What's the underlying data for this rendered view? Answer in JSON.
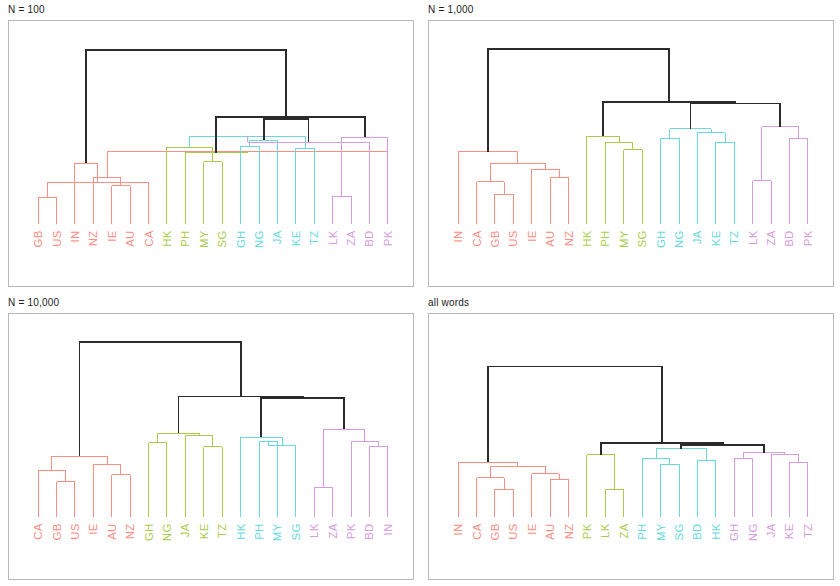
{
  "figure": {
    "width": 840,
    "height": 586,
    "background": "#ffffff",
    "panel_count": 4
  },
  "palette": {
    "red": "#f98d81",
    "green": "#a8cd4a",
    "cyan": "#67d9de",
    "magenta": "#d79ae0",
    "root": "#2b2b2b",
    "frame": "#b9b9b9",
    "title": "#1c1c1c"
  },
  "panels": [
    {
      "id": "panel-n-100",
      "title": "N = 100",
      "chart_data": {
        "type": "dendrogram",
        "title": "N = 100",
        "leaves": [
          "GB",
          "US",
          "IN",
          "NZ",
          "IE",
          "AU",
          "CA",
          "HK",
          "PH",
          "MY",
          "SG",
          "GH",
          "NG",
          "JA",
          "KE",
          "TZ",
          "LK",
          "ZA",
          "BD",
          "PK"
        ],
        "leaf_colors": [
          "red",
          "red",
          "red",
          "red",
          "red",
          "red",
          "red",
          "green",
          "green",
          "green",
          "green",
          "cyan",
          "cyan",
          "cyan",
          "cyan",
          "cyan",
          "magenta",
          "magenta",
          "magenta",
          "magenta"
        ],
        "ylim": [
          0,
          1
        ],
        "grid": false,
        "merges": [
          {
            "left": 0,
            "right": 1,
            "height": 0.14,
            "color": "red"
          },
          {
            "left": 4,
            "right": 5,
            "height": 0.2,
            "color": "red"
          },
          {
            "left": 20,
            "right": 6,
            "height": 0.215,
            "color": "red"
          },
          {
            "left": 3,
            "right": 21,
            "height": 0.245,
            "color": "red"
          },
          {
            "left": 2,
            "right": 22,
            "height": 0.315,
            "color": "red"
          },
          {
            "left": 19,
            "right": 23,
            "height": 0.375,
            "color": "red"
          },
          {
            "left": 9,
            "right": 10,
            "height": 0.325,
            "color": "green"
          },
          {
            "left": 8,
            "right": 25,
            "height": 0.37,
            "color": "green"
          },
          {
            "left": 7,
            "right": 26,
            "height": 0.4,
            "color": "green"
          },
          {
            "left": 11,
            "right": 12,
            "height": 0.405,
            "color": "cyan"
          },
          {
            "left": 14,
            "right": 15,
            "height": 0.395,
            "color": "cyan"
          },
          {
            "left": 13,
            "right": 29,
            "height": 0.435,
            "color": "cyan"
          },
          {
            "left": 28,
            "right": 30,
            "height": 0.455,
            "color": "cyan"
          },
          {
            "left": 16,
            "right": 17,
            "height": 0.145,
            "color": "magenta"
          },
          {
            "left": 32,
            "right": 18,
            "height": 0.425,
            "color": "magenta"
          },
          {
            "left": 33,
            "right": 19,
            "height": 0.45,
            "color": "magenta"
          },
          {
            "left": 31,
            "right": 34,
            "height": 0.545,
            "color": "root"
          },
          {
            "left": 27,
            "right": 35,
            "height": 0.555,
            "color": "root"
          },
          {
            "left": 24,
            "right": 36,
            "height": 0.9,
            "color": "root"
          }
        ]
      }
    },
    {
      "id": "panel-n-1000",
      "title": "N = 1,000",
      "chart_data": {
        "type": "dendrogram",
        "title": "N = 1,000",
        "leaves": [
          "IN",
          "CA",
          "GB",
          "US",
          "IE",
          "AU",
          "NZ",
          "HK",
          "PH",
          "MY",
          "SG",
          "GH",
          "NG",
          "JA",
          "KE",
          "TZ",
          "LK",
          "ZA",
          "BD",
          "PK"
        ],
        "leaf_colors": [
          "red",
          "red",
          "red",
          "red",
          "red",
          "red",
          "red",
          "green",
          "green",
          "green",
          "green",
          "cyan",
          "cyan",
          "cyan",
          "cyan",
          "cyan",
          "magenta",
          "magenta",
          "magenta",
          "magenta"
        ],
        "ylim": [
          0,
          1
        ],
        "grid": false,
        "merges": [
          {
            "left": 2,
            "right": 3,
            "height": 0.155,
            "color": "red"
          },
          {
            "left": 1,
            "right": 20,
            "height": 0.22,
            "color": "red"
          },
          {
            "left": 5,
            "right": 6,
            "height": 0.245,
            "color": "red"
          },
          {
            "left": 4,
            "right": 22,
            "height": 0.285,
            "color": "red"
          },
          {
            "left": 21,
            "right": 23,
            "height": 0.315,
            "color": "red"
          },
          {
            "left": 0,
            "right": 24,
            "height": 0.375,
            "color": "red"
          },
          {
            "left": 9,
            "right": 10,
            "height": 0.385,
            "color": "green"
          },
          {
            "left": 8,
            "right": 26,
            "height": 0.425,
            "color": "green"
          },
          {
            "left": 7,
            "right": 27,
            "height": 0.455,
            "color": "green"
          },
          {
            "left": 11,
            "right": 12,
            "height": 0.445,
            "color": "cyan"
          },
          {
            "left": 14,
            "right": 15,
            "height": 0.425,
            "color": "cyan"
          },
          {
            "left": 13,
            "right": 30,
            "height": 0.475,
            "color": "cyan"
          },
          {
            "left": 29,
            "right": 31,
            "height": 0.495,
            "color": "cyan"
          },
          {
            "left": 16,
            "right": 17,
            "height": 0.225,
            "color": "magenta"
          },
          {
            "left": 18,
            "right": 19,
            "height": 0.445,
            "color": "magenta"
          },
          {
            "left": 33,
            "right": 34,
            "height": 0.505,
            "color": "magenta"
          },
          {
            "left": 32,
            "right": 35,
            "height": 0.625,
            "color": "root"
          },
          {
            "left": 28,
            "right": 36,
            "height": 0.635,
            "color": "root"
          },
          {
            "left": 25,
            "right": 37,
            "height": 0.905,
            "color": "root"
          }
        ]
      }
    },
    {
      "id": "panel-n-10000",
      "title": "N = 10,000",
      "chart_data": {
        "type": "dendrogram",
        "title": "N = 10,000",
        "leaves": [
          "CA",
          "GB",
          "US",
          "IE",
          "AU",
          "NZ",
          "GH",
          "NG",
          "JA",
          "KE",
          "TZ",
          "HK",
          "PH",
          "MY",
          "SG",
          "LK",
          "ZA",
          "PK",
          "BD",
          "IN"
        ],
        "leaf_colors": [
          "red",
          "red",
          "red",
          "red",
          "red",
          "red",
          "green",
          "green",
          "green",
          "green",
          "green",
          "cyan",
          "cyan",
          "cyan",
          "cyan",
          "magenta",
          "magenta",
          "magenta",
          "magenta",
          "magenta"
        ],
        "ylim": [
          0,
          1
        ],
        "grid": false,
        "merges": [
          {
            "left": 1,
            "right": 2,
            "height": 0.185,
            "color": "red"
          },
          {
            "left": 0,
            "right": 20,
            "height": 0.245,
            "color": "red"
          },
          {
            "left": 4,
            "right": 5,
            "height": 0.22,
            "color": "red"
          },
          {
            "left": 3,
            "right": 22,
            "height": 0.275,
            "color": "red"
          },
          {
            "left": 21,
            "right": 23,
            "height": 0.315,
            "color": "red"
          },
          {
            "left": 6,
            "right": 7,
            "height": 0.385,
            "color": "green"
          },
          {
            "left": 9,
            "right": 10,
            "height": 0.365,
            "color": "green"
          },
          {
            "left": 8,
            "right": 26,
            "height": 0.425,
            "color": "green"
          },
          {
            "left": 25,
            "right": 27,
            "height": 0.435,
            "color": "green"
          },
          {
            "left": 12,
            "right": 13,
            "height": 0.395,
            "color": "cyan"
          },
          {
            "left": 29,
            "right": 14,
            "height": 0.37,
            "color": "cyan"
          },
          {
            "left": 11,
            "right": 30,
            "height": 0.415,
            "color": "cyan"
          },
          {
            "left": 15,
            "right": 16,
            "height": 0.155,
            "color": "magenta"
          },
          {
            "left": 18,
            "right": 19,
            "height": 0.365,
            "color": "magenta"
          },
          {
            "left": 17,
            "right": 33,
            "height": 0.395,
            "color": "magenta"
          },
          {
            "left": 32,
            "right": 34,
            "height": 0.455,
            "color": "magenta"
          },
          {
            "left": 31,
            "right": 35,
            "height": 0.615,
            "color": "root"
          },
          {
            "left": 28,
            "right": 36,
            "height": 0.625,
            "color": "root"
          },
          {
            "left": 24,
            "right": 37,
            "height": 0.905,
            "color": "root"
          }
        ]
      }
    },
    {
      "id": "panel-all-words",
      "title": "all words",
      "chart_data": {
        "type": "dendrogram",
        "title": "all words",
        "leaves": [
          "IN",
          "CA",
          "GB",
          "US",
          "IE",
          "AU",
          "NZ",
          "PK",
          "LK",
          "ZA",
          "PH",
          "MY",
          "SG",
          "BD",
          "HK",
          "GH",
          "NG",
          "JA",
          "KE",
          "TZ"
        ],
        "leaf_colors": [
          "red",
          "red",
          "red",
          "red",
          "red",
          "red",
          "red",
          "green",
          "green",
          "green",
          "cyan",
          "cyan",
          "cyan",
          "cyan",
          "cyan",
          "magenta",
          "magenta",
          "magenta",
          "magenta",
          "magenta"
        ],
        "ylim": [
          0,
          1
        ],
        "grid": false,
        "merges": [
          {
            "left": 2,
            "right": 3,
            "height": 0.145,
            "color": "red"
          },
          {
            "left": 1,
            "right": 20,
            "height": 0.205,
            "color": "red"
          },
          {
            "left": 5,
            "right": 6,
            "height": 0.195,
            "color": "red"
          },
          {
            "left": 4,
            "right": 22,
            "height": 0.225,
            "color": "red"
          },
          {
            "left": 21,
            "right": 23,
            "height": 0.265,
            "color": "red"
          },
          {
            "left": 0,
            "right": 24,
            "height": 0.285,
            "color": "red"
          },
          {
            "left": 8,
            "right": 9,
            "height": 0.145,
            "color": "green"
          },
          {
            "left": 7,
            "right": 26,
            "height": 0.325,
            "color": "green"
          },
          {
            "left": 11,
            "right": 12,
            "height": 0.275,
            "color": "cyan"
          },
          {
            "left": 10,
            "right": 28,
            "height": 0.305,
            "color": "cyan"
          },
          {
            "left": 13,
            "right": 14,
            "height": 0.295,
            "color": "cyan"
          },
          {
            "left": 29,
            "right": 30,
            "height": 0.355,
            "color": "cyan"
          },
          {
            "left": 15,
            "right": 16,
            "height": 0.305,
            "color": "magenta"
          },
          {
            "left": 18,
            "right": 19,
            "height": 0.285,
            "color": "magenta"
          },
          {
            "left": 17,
            "right": 33,
            "height": 0.325,
            "color": "magenta"
          },
          {
            "left": 32,
            "right": 34,
            "height": 0.335,
            "color": "magenta"
          },
          {
            "left": 31,
            "right": 35,
            "height": 0.375,
            "color": "root"
          },
          {
            "left": 27,
            "right": 36,
            "height": 0.385,
            "color": "root"
          },
          {
            "left": 25,
            "right": 37,
            "height": 0.78,
            "color": "root"
          }
        ]
      }
    }
  ]
}
